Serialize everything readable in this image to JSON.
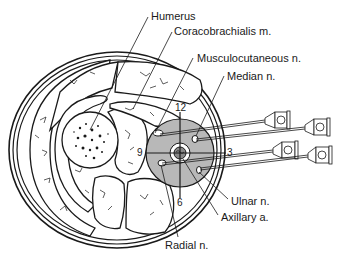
{
  "diagram": {
    "type": "anatomical cross-section",
    "labels": {
      "humerus": "Humerus",
      "coracobrachialis": "Coracobrachialis m.",
      "musculocutaneous": "Musculocutaneous n.",
      "median": "Median n.",
      "ulnar": "Ulnar n.",
      "axillary": "Axillary a.",
      "radial": "Radial n."
    },
    "clock_positions": {
      "twelve": "12",
      "three": "3",
      "six": "6",
      "nine": "9"
    },
    "needle_count": 4,
    "colors": {
      "line": "#1a1a1a",
      "sheath_fill": "#b8b8b8",
      "background": "#ffffff"
    }
  }
}
